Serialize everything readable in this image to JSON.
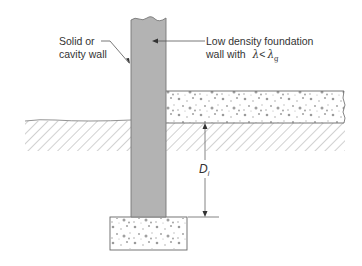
{
  "diagram": {
    "labels": {
      "wall_line1": "Solid or",
      "wall_line2": "cavity wall",
      "foundation_line1": "Low density foundation",
      "foundation_line2_prefix": "wall with",
      "lambda": "λ",
      "less_than": "<",
      "lambda_g": "λ",
      "lambda_g_sub": "g",
      "depth_symbol": "D",
      "depth_sub": "i"
    },
    "elements": [
      {
        "name": "wall",
        "type": "rect",
        "fill": "#b3b3b3"
      },
      {
        "name": "footing",
        "type": "rect",
        "pattern": "concrete-dots"
      },
      {
        "name": "floor-slab",
        "type": "rect",
        "pattern": "concrete-dots"
      },
      {
        "name": "ground-left",
        "type": "hatch"
      },
      {
        "name": "ground-right",
        "type": "hatch"
      },
      {
        "name": "depth-dimension",
        "type": "arrow",
        "label": "D_i"
      }
    ],
    "colors": {
      "wall_fill": "#b3b3b3",
      "line": "#666666",
      "dots": "#9a9a9a",
      "hatch": "#8c8c8c"
    }
  }
}
